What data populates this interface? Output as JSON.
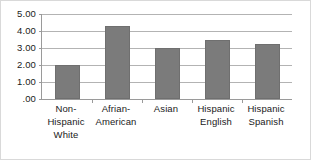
{
  "chart_data": {
    "type": "bar",
    "title": "",
    "subtitle": "",
    "xlabel": "",
    "ylabel": "",
    "categories": [
      "Non-Hispanic White",
      "Afrian-American",
      "Asian",
      "Hispanic English",
      "Hispanic Spanish"
    ],
    "category_lines": [
      [
        "Non-",
        "Hispanic",
        "White"
      ],
      [
        "Afrian-",
        "American"
      ],
      [
        "Asian"
      ],
      [
        "Hispanic",
        "English"
      ],
      [
        "Hispanic",
        "Spanish"
      ]
    ],
    "values": [
      2.0,
      4.32,
      3.0,
      3.47,
      3.24
    ],
    "ylim": [
      0,
      5
    ],
    "ytick_values": [
      5.0,
      4.0,
      3.0,
      2.0,
      1.0,
      0.0
    ],
    "ytick_labels": [
      "5.00",
      "4.00",
      "3.00",
      "2.00",
      "1.00",
      ".00"
    ],
    "grid": true,
    "grid_axis": "y",
    "legend": false,
    "legend_position": "none",
    "bar_color": "#7b7b7b",
    "bar_edge_color": "#6f6f6f",
    "gridline_color": "#b3b3b3",
    "axis_color": "#9a9a9a",
    "text_color": "#1a1a1a",
    "background_color": "#ffffff",
    "border_color": "#d9d9d9"
  }
}
